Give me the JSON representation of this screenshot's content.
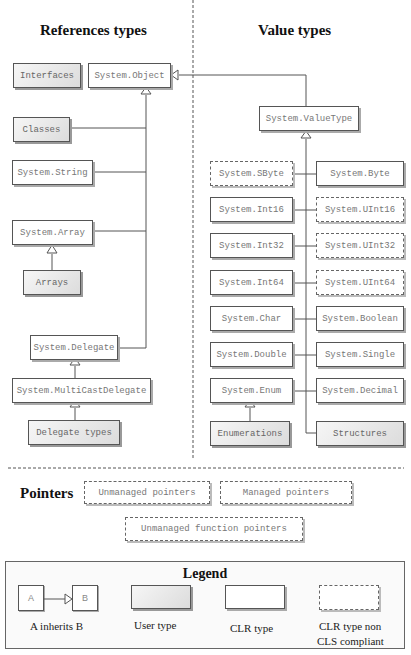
{
  "headings": {
    "reference_types": "References types",
    "value_types": "Value types",
    "pointers": "Pointers"
  },
  "reference_types": {
    "interfaces": "Interfaces",
    "system_object": "System.Object",
    "classes": "Classes",
    "system_string": "System.String",
    "system_array": "System.Array",
    "arrays": "Arrays",
    "system_delegate": "System.Delegate",
    "system_multicastdelegate": "System.MultiCastDelegate",
    "delegate_types": "Delegate types"
  },
  "value_types": {
    "system_valuetype": "System.ValueType",
    "system_sbyte": "System.SByte",
    "system_byte": "System.Byte",
    "system_int16": "System.Int16",
    "system_uint16": "System.UInt16",
    "system_int32": "System.Int32",
    "system_uint32": "System.UInt32",
    "system_int64": "System.Int64",
    "system_uint64": "System.UInt64",
    "system_char": "System.Char",
    "system_boolean": "System.Boolean",
    "system_double": "System.Double",
    "system_single": "System.Single",
    "system_enum": "System.Enum",
    "system_decimal": "System.Decimal",
    "enumerations": "Enumerations",
    "structures": "Structures"
  },
  "pointers": {
    "unmanaged_pointers": "Unmanaged pointers",
    "managed_pointers": "Managed pointers",
    "unmanaged_function_pointers": "Unmanaged function pointers"
  },
  "legend": {
    "title": "Legend",
    "box_a": "A",
    "box_b": "B",
    "inherits_caption": "A inherits B",
    "user_type_caption": "User type",
    "clr_type_caption": "CLR type",
    "non_cls_caption_line1": "CLR type non",
    "non_cls_caption_line2": "CLS compliant"
  }
}
